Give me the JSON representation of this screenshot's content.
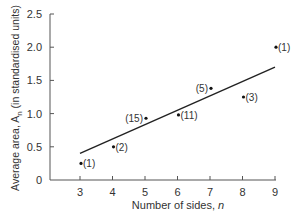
{
  "chart_data": {
    "type": "scatter",
    "title": "",
    "xlabel": "Number of sides, n",
    "ylabel": "Average area, A_n (in standardised units)",
    "xlim": [
      2.1,
      9.1
    ],
    "ylim": [
      0,
      2.5
    ],
    "xticks": [
      3,
      4,
      5,
      6,
      7,
      8,
      9
    ],
    "yticks": [
      0,
      0.5,
      1.0,
      1.5,
      2.0,
      2.5
    ],
    "ytick_labels": [
      "0",
      "0.5",
      "1.0",
      "1.5",
      "2.0",
      "2.5"
    ],
    "grid": false,
    "points": [
      {
        "x": 3,
        "y": 0.25,
        "label": "(1)"
      },
      {
        "x": 4,
        "y": 0.5,
        "label": "(2)"
      },
      {
        "x": 5,
        "y": 0.93,
        "label": "(15)"
      },
      {
        "x": 6,
        "y": 0.98,
        "label": "(11)"
      },
      {
        "x": 7,
        "y": 1.38,
        "label": "(5)"
      },
      {
        "x": 8,
        "y": 1.25,
        "label": "(3)"
      },
      {
        "x": 9,
        "y": 2.0,
        "label": "(1)"
      }
    ],
    "trendline": {
      "x1": 3,
      "y1": 0.4,
      "x2": 9,
      "y2": 1.7
    }
  },
  "labels": {
    "xlabel_text": "Number of sides, ",
    "xlabel_var": "n",
    "ylabel_text": "Average area, A",
    "ylabel_sub": "n",
    "ylabel_rest": " (in standardised units)"
  }
}
